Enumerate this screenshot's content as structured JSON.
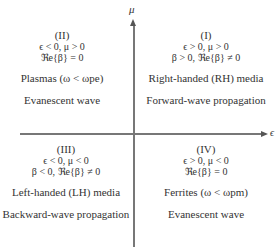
{
  "axes": {
    "vertical_label": "μ",
    "horizontal_label": "ϵ"
  },
  "quadrants": {
    "I": {
      "number": "(I)",
      "condition1": "ϵ > 0, μ > 0",
      "condition2": "β > 0, ℜe{β} ≠ 0",
      "media": "Right-handed (RH) media",
      "wave": "Forward-wave propagation"
    },
    "II": {
      "number": "(II)",
      "condition1": "ϵ < 0, μ > 0",
      "condition2": "ℜe{β} = 0",
      "media": "Plasmas (ω < ωpe)",
      "wave": "Evanescent wave"
    },
    "III": {
      "number": "(III)",
      "condition1": "ϵ < 0, μ < 0",
      "condition2": "β < 0, ℜe{β} ≠ 0",
      "media": "Left-handed (LH) media",
      "wave": "Backward-wave propagation"
    },
    "IV": {
      "number": "(IV)",
      "condition1": "ϵ > 0, μ < 0",
      "condition2": "ℜe{β} = 0",
      "media": "Ferrites (ω < ωpm)",
      "wave": "Evanescent wave"
    }
  }
}
